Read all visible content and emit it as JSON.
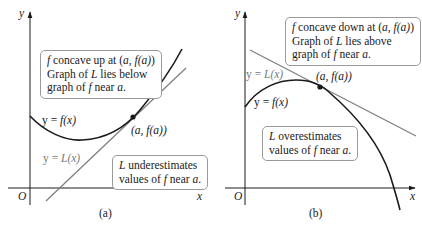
{
  "panels": [
    {
      "id": "a",
      "caption": "(a)",
      "axis": {
        "x_label": "x",
        "y_label": "y",
        "origin_label": "O"
      },
      "curve_label": {
        "lhs": "y = ",
        "fn": "f(x)"
      },
      "line_label": {
        "lhs": "y = ",
        "fn": "L(x)"
      },
      "point_label": "(a,  f(a))",
      "info_box": {
        "line1_f": "f",
        "line1_rest": " concave up at (",
        "line1_a": "a",
        "line1_sep": ",  ",
        "line1_fa": "f(a)",
        "line1_end": ")",
        "line2_pre": "Graph of ",
        "line2_L": "L",
        "line2_post": " lies below",
        "line3_pre": "graph of ",
        "line3_f": "f",
        "line3_mid": " near ",
        "line3_a": "a",
        "line3_end": "."
      },
      "estimate_box": {
        "line1_L": "L",
        "line1_rest": " underestimates",
        "line2_pre": "values of ",
        "line2_f": "f",
        "line2_mid": " near ",
        "line2_a": "a",
        "line2_end": "."
      }
    },
    {
      "id": "b",
      "caption": "(b)",
      "axis": {
        "x_label": "x",
        "y_label": "y",
        "origin_label": "O"
      },
      "curve_label": {
        "lhs": "y = ",
        "fn": "f(x)"
      },
      "line_label": {
        "lhs": "y = ",
        "fn": "L(x)"
      },
      "point_label": "(a,  f(a))",
      "info_box": {
        "line1_f": "f",
        "line1_rest": " concave down at (",
        "line1_a": "a",
        "line1_sep": ",  ",
        "line1_fa": "f(a)",
        "line1_end": ")",
        "line2_pre": "Graph of ",
        "line2_L": "L",
        "line2_post": " lies above",
        "line3_pre": "graph of ",
        "line3_f": "f",
        "line3_mid": " near ",
        "line3_a": "a",
        "line3_end": "."
      },
      "estimate_box": {
        "line1_L": "L",
        "line1_rest": " overestimates",
        "line2_pre": "values of ",
        "line2_f": "f",
        "line2_mid": " near ",
        "line2_a": "a",
        "line2_end": "."
      }
    }
  ],
  "colors": {
    "curve": "#1a1a1a",
    "tangent_line": "#808080",
    "box_border": "#9a9a9a",
    "axis": "#1a1a1a"
  }
}
